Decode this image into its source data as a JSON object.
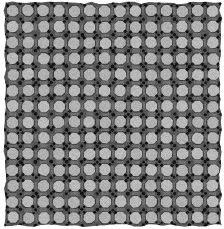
{
  "image": {
    "kind": "grayscale-lattice-micrograph",
    "title": "",
    "width": 224,
    "height": 229,
    "background_color": "#ffffff"
  },
  "chart_data": {
    "type": "heatmap",
    "title": "",
    "subtitle": "",
    "xlabel": "",
    "ylabel": "",
    "legend": [],
    "annotations": [],
    "grid": false,
    "description": "Periodic truncated-square-tiling lattice of light gray octagons separated by dark gray bands with near-black dots at the square vertices",
    "lattice": {
      "tiling": "truncated-square",
      "columns": 14,
      "rows": 14,
      "pitch_x": 15.4,
      "pitch_y": 15.9,
      "origin_x": 5,
      "origin_y": 3,
      "octagon_radius": 6.1,
      "band_width": 3.6,
      "dot_radius": 1.7,
      "edge_jitter": 1.4,
      "position_jitter": 0.55,
      "noise_amplitude": 10,
      "noise_seed": 20240517
    },
    "colors": {
      "background": "#ffffff",
      "octagon_fill": "#b9b9b9",
      "octagon_fill_alt": "#b1b1b1",
      "band_dark": "#555555",
      "band_mid": "#6e6e6e",
      "vertex_dot": "#141414",
      "edge_shadow": "#3d3d3d"
    },
    "value_range": [
      20,
      185
    ],
    "ylim": [
      0,
      229
    ],
    "xlim": [
      0,
      224
    ]
  }
}
